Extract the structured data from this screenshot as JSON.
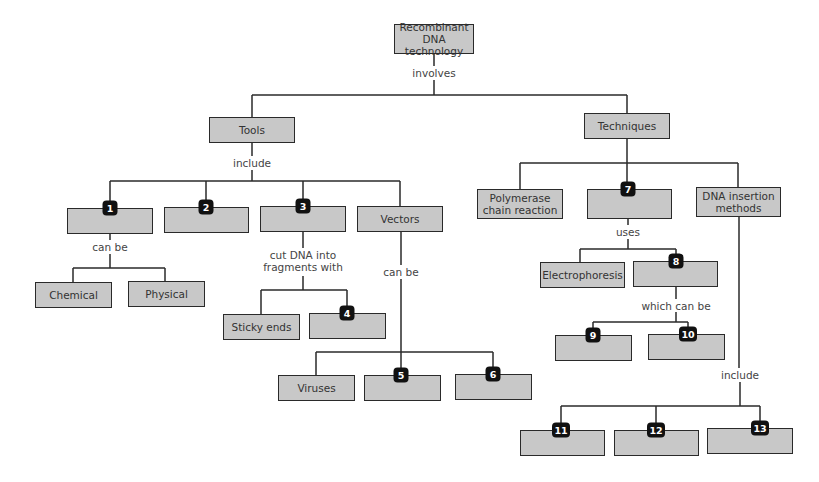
{
  "diagram": {
    "root": "Recombinant DNA technology",
    "root_link": "involves",
    "branches": {
      "tools": {
        "label": "Tools",
        "link": "include",
        "children": {
          "item1": {
            "badge": "1",
            "link": "can be",
            "children": [
              "Chemical",
              "Physical"
            ]
          },
          "item2": {
            "badge": "2"
          },
          "item3": {
            "badge": "3",
            "link": "cut DNA into fragments with",
            "children": {
              "sticky": "Sticky ends",
              "item4_badge": "4"
            }
          },
          "vectors": {
            "label": "Vectors",
            "link": "can be",
            "children": {
              "viruses": "Viruses",
              "item5_badge": "5",
              "item6_badge": "6"
            }
          }
        }
      },
      "techniques": {
        "label": "Techniques",
        "children": {
          "pcr": "Polymerase chain reaction",
          "item7": {
            "badge": "7",
            "link": "uses",
            "children": {
              "electrophoresis": "Electrophoresis",
              "item8": {
                "badge": "8",
                "link": "which can be",
                "children": {
                  "item9_badge": "9",
                  "item10_badge": "10"
                }
              }
            }
          },
          "insertion": {
            "label": "DNA insertion methods",
            "link": "include",
            "children": {
              "item11_badge": "11",
              "item12_badge": "12",
              "item13_badge": "13"
            }
          }
        }
      }
    }
  },
  "colors": {
    "box_fill": "#c8c8c8",
    "box_border": "#2a2a2a",
    "badge": "#111111",
    "line": "#2a2a2a"
  }
}
